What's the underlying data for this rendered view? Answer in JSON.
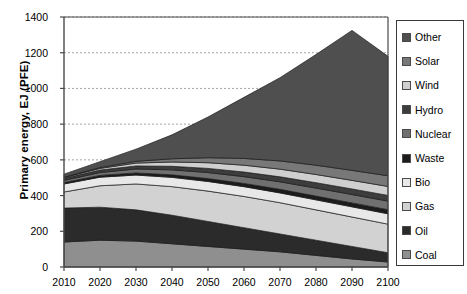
{
  "chart_data": {
    "type": "area",
    "stacked": true,
    "title": "",
    "xlabel": "",
    "ylabel": "Primary energy, EJ (PFE)",
    "x": [
      2010,
      2020,
      2030,
      2040,
      2050,
      2060,
      2070,
      2080,
      2090,
      2100
    ],
    "xlim": [
      2010,
      2100
    ],
    "ylim": [
      0,
      1400
    ],
    "ytick_labels": [
      "0",
      "200",
      "400",
      "600",
      "800",
      "1000",
      "1200",
      "1400"
    ],
    "yticks": [
      0,
      200,
      400,
      600,
      800,
      1000,
      1200,
      1400
    ],
    "xtick_labels": [
      "2010",
      "2020",
      "2030",
      "2040",
      "2050",
      "2060",
      "2070",
      "2080",
      "2090",
      "2100"
    ],
    "grid": "horizontal-dashed",
    "legend_position": "right-outside",
    "legend_order": [
      "Other",
      "Solar",
      "Wind",
      "Hydro",
      "Nuclear",
      "Waste",
      "Bio",
      "Gas",
      "Oil",
      "Coal"
    ],
    "stack_order_bottom_to_top": [
      "Coal",
      "Oil",
      "Gas",
      "Bio",
      "Waste",
      "Nuclear",
      "Hydro",
      "Wind",
      "Solar",
      "Other"
    ],
    "series": [
      {
        "name": "Coal",
        "color": "#8f8f8f",
        "values": [
          140,
          150,
          145,
          130,
          115,
          100,
          85,
          65,
          45,
          28
        ]
      },
      {
        "name": "Oil",
        "color": "#2b2b2b",
        "values": [
          190,
          185,
          175,
          160,
          140,
          120,
          100,
          85,
          70,
          52
        ]
      },
      {
        "name": "Gas",
        "color": "#d2d2d2",
        "values": [
          90,
          120,
          145,
          160,
          170,
          175,
          175,
          170,
          165,
          160
        ]
      },
      {
        "name": "Bio",
        "color": "#e8e8e8",
        "values": [
          45,
          48,
          50,
          52,
          54,
          55,
          55,
          56,
          57,
          58
        ]
      },
      {
        "name": "Waste",
        "color": "#1c1c1c",
        "values": [
          8,
          10,
          12,
          14,
          16,
          18,
          20,
          21,
          22,
          23
        ]
      },
      {
        "name": "Nuclear",
        "color": "#707070",
        "values": [
          12,
          16,
          22,
          28,
          34,
          38,
          42,
          45,
          47,
          48
        ]
      },
      {
        "name": "Hydro",
        "color": "#3d3d3d",
        "values": [
          12,
          14,
          17,
          20,
          23,
          26,
          28,
          30,
          31,
          32
        ]
      },
      {
        "name": "Wind",
        "color": "#cfcfcf",
        "values": [
          4,
          9,
          16,
          24,
          32,
          38,
          43,
          46,
          48,
          50
        ]
      },
      {
        "name": "Solar",
        "color": "#787878",
        "values": [
          2,
          5,
          10,
          18,
          28,
          38,
          46,
          52,
          56,
          60
        ]
      },
      {
        "name": "Other",
        "color": "#4f4f4f",
        "values": [
          17,
          33,
          68,
          134,
          228,
          342,
          466,
          620,
          784,
          669
        ]
      }
    ],
    "totals": [
      520,
      590,
      660,
      740,
      840,
      950,
      1060,
      1190,
      1325,
      1180
    ]
  },
  "legend": {
    "items": [
      {
        "label": "Other",
        "color": "#4f4f4f"
      },
      {
        "label": "Solar",
        "color": "#787878"
      },
      {
        "label": "Wind",
        "color": "#cfcfcf"
      },
      {
        "label": "Hydro",
        "color": "#3d3d3d"
      },
      {
        "label": "Nuclear",
        "color": "#707070"
      },
      {
        "label": "Waste",
        "color": "#1c1c1c"
      },
      {
        "label": "Bio",
        "color": "#e8e8e8"
      },
      {
        "label": "Gas",
        "color": "#d2d2d2"
      },
      {
        "label": "Oil",
        "color": "#2b2b2b"
      },
      {
        "label": "Coal",
        "color": "#8f8f8f"
      }
    ]
  },
  "colors": {
    "axis": "#4a4a4a",
    "grid": "#9a9a9a",
    "text": "#000000",
    "background": "#ffffff"
  }
}
